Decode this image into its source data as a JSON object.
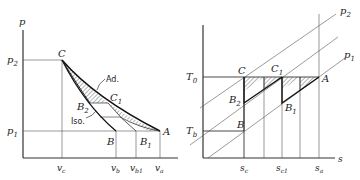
{
  "left_diagram": {
    "y_axis_label": "p",
    "p2_label": "p",
    "p2_sub": "2",
    "p1_label": "p",
    "p1_sub": "1",
    "points": {
      "C": "C",
      "C1": "C",
      "C1_sub": "1",
      "B2": "B",
      "B2_sub": "2",
      "B": "B",
      "B1": "B",
      "B1_sub": "1",
      "A": "A"
    },
    "curve_labels": {
      "adiabatic": "Ad.",
      "isothermal": "Iso."
    },
    "x_ticks": [
      {
        "main": "v",
        "sub": "c"
      },
      {
        "main": "v",
        "sub": "b"
      },
      {
        "main": "v",
        "sub": "b1"
      },
      {
        "main": "v",
        "sub": "a"
      }
    ]
  },
  "right_diagram": {
    "x_axis_label": "s",
    "T0_label": "T",
    "T0_sub": "0",
    "Tb_label": "T",
    "Tb_sub": "b",
    "isobar_p2": "p",
    "isobar_p2_sub": "2",
    "isobar_p1": "p",
    "isobar_p1_sub": "1",
    "points": {
      "C": "C",
      "C1": "C",
      "C1_sub": "1",
      "B2": "B",
      "B2_sub": "2",
      "B": "B",
      "B1": "B",
      "B1_sub": "1",
      "A": "A"
    },
    "x_ticks": [
      {
        "main": "s",
        "sub": "c"
      },
      {
        "main": "s",
        "sub": "c1"
      },
      {
        "main": "s",
        "sub": "a"
      }
    ]
  }
}
